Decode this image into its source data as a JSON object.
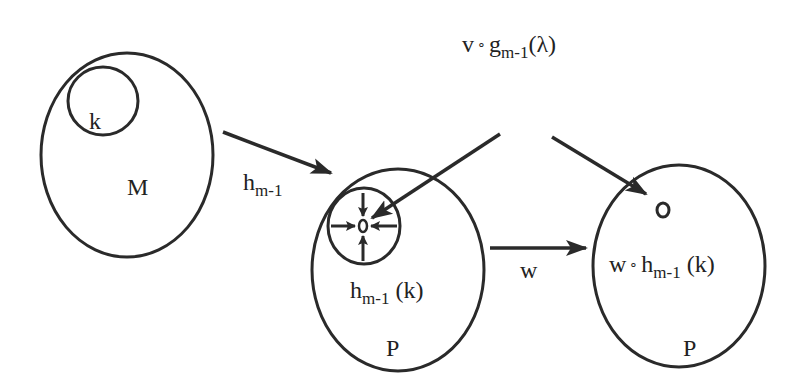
{
  "diagram": {
    "stroke_color": "#2a2a2a",
    "sets": [
      {
        "id": "M",
        "label": "M"
      },
      {
        "id": "P1",
        "label": "P"
      },
      {
        "id": "P2",
        "label": "P"
      }
    ],
    "subsets": {
      "k": "k",
      "h_image": {
        "base": "h",
        "sub": "m-1",
        "arg": " (k)"
      },
      "w_image": {
        "pre": "w",
        "op": "∘",
        "base": "h",
        "sub": "m-1",
        "arg": " (k)"
      }
    },
    "top_label": {
      "pre": "v",
      "op": "∘",
      "base": "g",
      "sub": "m-1",
      "arg": "(λ)"
    },
    "arrows": {
      "h": {
        "base": "h",
        "sub": "m-1"
      },
      "w": {
        "label": "w"
      }
    }
  }
}
